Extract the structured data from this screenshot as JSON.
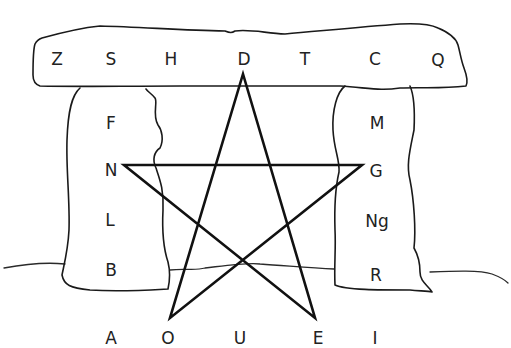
{
  "diagram": {
    "title_fragment": "",
    "capstone_letters": [
      "Z",
      "S",
      "H",
      "D",
      "T",
      "C",
      "Q"
    ],
    "left_pillar_letters": [
      "F",
      "N",
      "L",
      "B"
    ],
    "right_pillar_letters": [
      "M",
      "G",
      "Ng",
      "R"
    ],
    "bottom_letters": [
      "A",
      "O",
      "U",
      "E",
      "I"
    ],
    "star": {
      "shape": "pentagram",
      "points_at_letters": [
        "D",
        "N",
        "G",
        "O",
        "E"
      ]
    },
    "colors": {
      "line": "#111111",
      "text": "#222222",
      "background": "#ffffff"
    }
  }
}
